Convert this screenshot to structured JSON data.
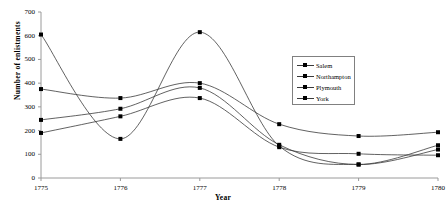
{
  "chart_data": {
    "type": "line",
    "title": "",
    "xlabel": "Year",
    "ylabel": "Number of enlistments",
    "categories": [
      "1775",
      "1776",
      "1777",
      "1778",
      "1779",
      "1780"
    ],
    "x": [
      1775,
      1776,
      1777,
      1778,
      1779,
      1780
    ],
    "xlim": [
      1775,
      1780
    ],
    "ylim": [
      0,
      700
    ],
    "y_ticks": [
      "0",
      "100",
      "200",
      "300",
      "400",
      "500",
      "600",
      "700"
    ],
    "y_tick_values": [
      0,
      100,
      200,
      300,
      400,
      500,
      600,
      700
    ],
    "grid": false,
    "legend_position": "right-center",
    "smoothed": true,
    "marker": "square",
    "series": [
      {
        "name": "Salem",
        "values": [
          605,
          165,
          615,
          135,
          57,
          120
        ]
      },
      {
        "name": "Northampton",
        "values": [
          375,
          337,
          400,
          227,
          177,
          193
        ]
      },
      {
        "name": "Plymouth",
        "values": [
          245,
          292,
          380,
          140,
          57,
          138
        ]
      },
      {
        "name": "York",
        "values": [
          190,
          260,
          337,
          130,
          102,
          96
        ]
      }
    ],
    "colors": {
      "line": "#3a3a3a",
      "marker": "#000000",
      "axis": "#9a9a9a",
      "text": "#000000",
      "legend_border": "#808080"
    }
  },
  "axes": {
    "y_title": "Number of enlistments",
    "x_title": "Year"
  },
  "legend": {
    "entries": [
      {
        "label": "Salem"
      },
      {
        "label": "Northampton"
      },
      {
        "label": "Plymouth"
      },
      {
        "label": "York"
      }
    ]
  }
}
